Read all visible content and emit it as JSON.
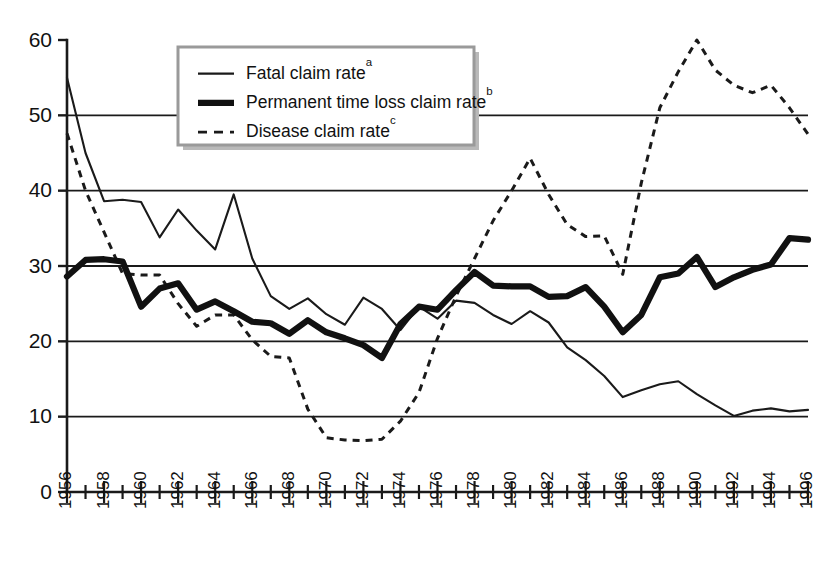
{
  "chart_data": {
    "type": "line",
    "title": "",
    "subtitle": "",
    "xlabel": "",
    "ylabel": "",
    "xlim": [
      1956,
      1996
    ],
    "ylim": [
      0,
      60
    ],
    "ytick_step": 10,
    "yticks": [
      0,
      10,
      20,
      30,
      40,
      50,
      60
    ],
    "ytick_labels": [
      "0",
      "10",
      "20",
      "30",
      "40",
      "50",
      "60"
    ],
    "gridlines": [
      10,
      20,
      30,
      40,
      50
    ],
    "grid": true,
    "xtick_step_minor": 1,
    "xtick_step_major": 2,
    "legend_position": "top-center",
    "x": [
      1956,
      1957,
      1958,
      1959,
      1960,
      1961,
      1962,
      1963,
      1964,
      1965,
      1966,
      1967,
      1968,
      1969,
      1970,
      1971,
      1972,
      1973,
      1974,
      1975,
      1976,
      1977,
      1978,
      1979,
      1980,
      1981,
      1982,
      1983,
      1984,
      1985,
      1986,
      1987,
      1988,
      1989,
      1990,
      1991,
      1992,
      1993,
      1994,
      1995,
      1996
    ],
    "xtick_labels": [
      "1956",
      "1958",
      "1960",
      "1962",
      "1964",
      "1966",
      "1968",
      "1970",
      "1972",
      "1974",
      "1976",
      "1978",
      "1980",
      "1982",
      "1984",
      "1986",
      "1988",
      "1990",
      "1992",
      "1994",
      "1996"
    ],
    "series": [
      {
        "name": "Fatal claim rate",
        "superscript": "a",
        "style": "solid-thin",
        "color": "#1a1a1a",
        "values": [
          55.0,
          45.0,
          38.6,
          38.8,
          38.5,
          33.8,
          37.5,
          34.7,
          32.2,
          39.5,
          31.0,
          26.0,
          24.3,
          25.7,
          23.6,
          22.2,
          25.8,
          24.3,
          21.5,
          24.6,
          23.0,
          25.4,
          25.1,
          23.5,
          22.3,
          24.0,
          22.5,
          19.2,
          17.5,
          15.4,
          12.6,
          13.5,
          14.3,
          14.7,
          13.0,
          11.5,
          10.1,
          10.8,
          11.1,
          10.7,
          10.9
        ]
      },
      {
        "name": "Permanent time loss claim rate",
        "superscript": "b",
        "style": "solid-thick",
        "color": "#111111",
        "values": [
          28.6,
          30.8,
          30.9,
          30.6,
          24.6,
          27.0,
          27.7,
          24.2,
          25.3,
          24.0,
          22.6,
          22.4,
          21.0,
          22.8,
          21.2,
          20.4,
          19.5,
          17.8,
          22.3,
          24.6,
          24.2,
          26.8,
          29.2,
          27.4,
          27.3,
          27.3,
          25.9,
          26.0,
          27.2,
          24.6,
          21.2,
          23.5,
          28.5,
          29.0,
          31.2,
          27.2,
          28.5,
          29.5,
          30.2,
          33.7,
          33.5
        ]
      },
      {
        "name": "Disease claim rate",
        "superscript": "c",
        "style": "dashed",
        "color": "#1a1a1a",
        "values": [
          47.6,
          40.0,
          34.5,
          29.0,
          28.8,
          28.8,
          25.0,
          22.0,
          23.5,
          23.5,
          20.2,
          18.0,
          17.8,
          11.0,
          7.2,
          6.9,
          6.8,
          7.0,
          9.4,
          13.2,
          20.4,
          26.0,
          31.0,
          36.0,
          40.0,
          44.3,
          39.5,
          35.5,
          33.9,
          34.0,
          28.9,
          41.0,
          51.0,
          55.8,
          60.0,
          56.0,
          54.0,
          53.0,
          54.0,
          51.0,
          47.5
        ]
      }
    ],
    "legend": [
      {
        "label": "Fatal claim rate",
        "superscript": "a",
        "style": "solid-thin"
      },
      {
        "label": "Permanent time loss claim rate",
        "superscript": "b",
        "style": "solid-thick"
      },
      {
        "label": "Disease claim rate",
        "superscript": "c",
        "style": "dashed"
      }
    ]
  },
  "geometry": {
    "plot_left": 67,
    "plot_right": 808,
    "plot_top": 40,
    "plot_bottom": 492,
    "legend_x": 178,
    "legend_y": 47,
    "legend_w": 296,
    "legend_h": 98
  }
}
